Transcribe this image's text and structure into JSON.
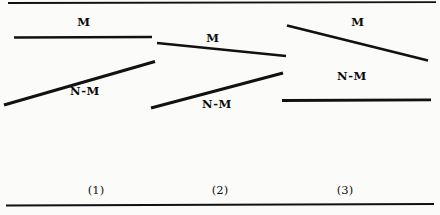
{
  "figure": {
    "background_color": "#fbfbf9",
    "ink_color": "#111111",
    "width": 440,
    "height": 215,
    "rules": [
      {
        "name": "top-rule",
        "x1": 8,
        "y1": 3,
        "x2": 436,
        "y2": 2.2,
        "width": 1.8
      },
      {
        "name": "bottom-rule",
        "x1": 6,
        "y1": 205.5,
        "x2": 434,
        "y2": 204.0,
        "width": 1.8
      }
    ],
    "panels": [
      {
        "id": "panel-1",
        "caption": "(1)",
        "caption_x": 96,
        "caption_y": 190,
        "curves": [
          {
            "name": "m-curve",
            "label": "M",
            "label_x": 84,
            "label_y": 22,
            "x1": 14,
            "y1": 37.5,
            "x2": 152,
            "y2": 37.0,
            "width": 2.6
          },
          {
            "name": "n-minus-m-curve",
            "label": "N-M",
            "label_x": 85,
            "label_y": 91,
            "x1": 4,
            "y1": 105.0,
            "x2": 155,
            "y2": 61.5,
            "width": 2.9
          }
        ]
      },
      {
        "id": "panel-2",
        "caption": "(2)",
        "caption_x": 220,
        "caption_y": 190,
        "curves": [
          {
            "name": "m-curve",
            "label": "M",
            "label_x": 213,
            "label_y": 38,
            "x1": 157,
            "y1": 43.0,
            "x2": 286,
            "y2": 56.0,
            "width": 2.7
          },
          {
            "name": "n-minus-m-curve",
            "label": "N-M",
            "label_x": 217,
            "label_y": 104,
            "x1": 151,
            "y1": 108.0,
            "x2": 283,
            "y2": 73.0,
            "width": 2.9
          }
        ]
      },
      {
        "id": "panel-3",
        "caption": "(3)",
        "caption_x": 345,
        "caption_y": 190,
        "curves": [
          {
            "name": "m-curve",
            "label": "M",
            "label_x": 358,
            "label_y": 22,
            "x1": 287,
            "y1": 25.5,
            "x2": 428,
            "y2": 60.5,
            "width": 2.8
          },
          {
            "name": "n-minus-m-curve",
            "label": "N-M",
            "label_x": 352,
            "label_y": 76,
            "x1": 282,
            "y1": 100.5,
            "x2": 431,
            "y2": 99.8,
            "width": 2.8
          }
        ]
      }
    ]
  }
}
